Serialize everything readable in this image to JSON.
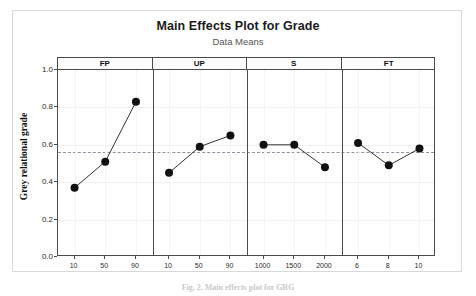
{
  "chart_data": {
    "type": "line",
    "title": "Main Effects Plot for Grade",
    "subtitle": "Data Means",
    "ylabel": "Grey relational grade",
    "xlabel": "",
    "ylim": [
      0.0,
      1.0
    ],
    "yticks": [
      "0.0",
      "0.2",
      "0.4",
      "0.6",
      "0.8",
      "1.0"
    ],
    "ytick_values": [
      0.0,
      0.2,
      0.4,
      0.6,
      0.8,
      1.0
    ],
    "grid": true,
    "legend": "none",
    "reference_line": {
      "label": "overall mean",
      "value": 0.56,
      "style": "dashed",
      "color": "#8f8f9c"
    },
    "marker": {
      "shape": "circle",
      "color": "#111111",
      "size": 4
    },
    "line_color": "#333333",
    "panels": [
      {
        "name": "FP",
        "categories": [
          "10",
          "50",
          "90"
        ],
        "values": [
          0.37,
          0.51,
          0.83
        ]
      },
      {
        "name": "UP",
        "categories": [
          "10",
          "50",
          "90"
        ],
        "values": [
          0.45,
          0.59,
          0.65
        ]
      },
      {
        "name": "S",
        "categories": [
          "1000",
          "1500",
          "2000"
        ],
        "values": [
          0.6,
          0.6,
          0.48
        ]
      },
      {
        "name": "FT",
        "categories": [
          "6",
          "8",
          "10"
        ],
        "values": [
          0.61,
          0.49,
          0.58
        ]
      }
    ]
  },
  "caption": {
    "text": "Fig. 2. Main effects plot for GRG"
  }
}
